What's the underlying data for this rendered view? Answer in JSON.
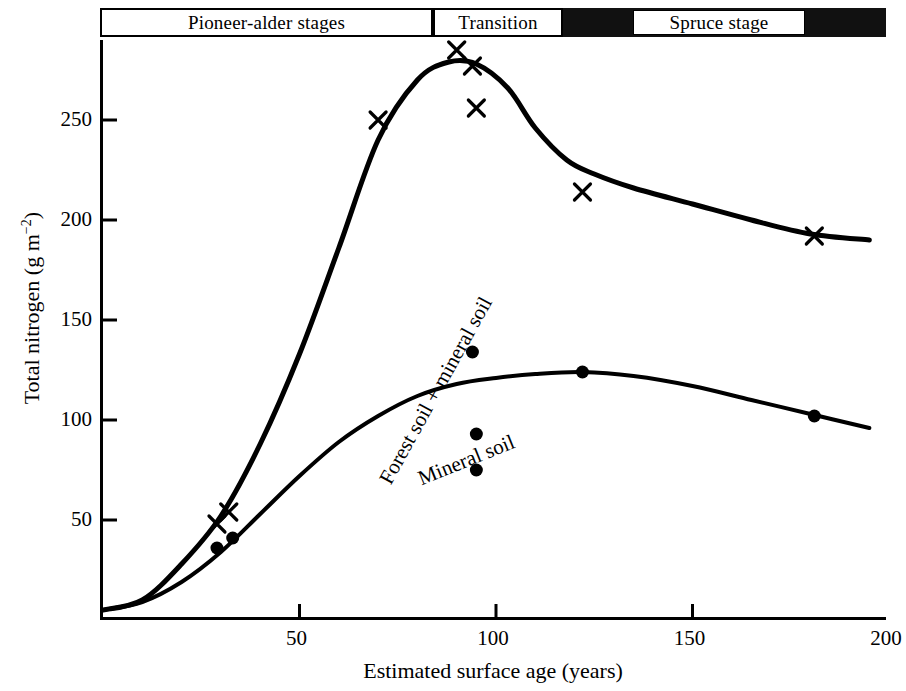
{
  "figure": {
    "background_color": "#ffffff",
    "ink_color": "#000000"
  },
  "stages": {
    "pioneer": "Pioneer-alder stages",
    "transition": "Transition",
    "spruce": "Spruce stage"
  },
  "axes": {
    "x_title": "Estimated surface age (years)",
    "y_title_main": "Total nitrogen (g m",
    "y_title_sup": "−2",
    "y_title_close": ")",
    "x_ticks": [
      "50",
      "100",
      "150",
      "200"
    ],
    "y_ticks": [
      "50",
      "100",
      "150",
      "200",
      "250"
    ]
  },
  "curve_labels": {
    "forest": "Forest soil + mineral soil",
    "mineral": "Mineral soil"
  },
  "chart_data": {
    "type": "line",
    "title": "",
    "subtitle": "",
    "xlabel": "Estimated surface age (years)",
    "ylabel": "Total nitrogen (g m−2)",
    "xlim": [
      0,
      200
    ],
    "ylim": [
      0,
      290
    ],
    "grid": false,
    "legend_position": "inline-curve-labels",
    "x_ticks": [
      50,
      100,
      150,
      200
    ],
    "y_ticks": [
      50,
      100,
      150,
      200,
      250
    ],
    "annotations": [
      {
        "text": "Pioneer-alder stages",
        "region": "banner",
        "x_range": [
          0,
          85
        ]
      },
      {
        "text": "Transition",
        "region": "banner",
        "x_range": [
          85,
          118
        ]
      },
      {
        "text": "Spruce stage",
        "region": "banner",
        "x_range": [
          118,
          200
        ]
      },
      {
        "text": "Forest soil + mineral soil",
        "region": "upper-curve",
        "rotation_deg": -61
      },
      {
        "text": "Mineral soil",
        "region": "lower-curve",
        "rotation_deg": -22
      }
    ],
    "series": [
      {
        "name": "Forest soil + mineral soil",
        "marker": "x",
        "curve": [
          [
            0,
            5
          ],
          [
            10,
            10
          ],
          [
            20,
            28
          ],
          [
            30,
            52
          ],
          [
            40,
            88
          ],
          [
            50,
            133
          ],
          [
            60,
            186
          ],
          [
            70,
            240
          ],
          [
            80,
            270
          ],
          [
            88,
            279
          ],
          [
            95,
            278
          ],
          [
            103,
            266
          ],
          [
            110,
            246
          ],
          [
            118,
            230
          ],
          [
            125,
            223
          ],
          [
            135,
            216
          ],
          [
            150,
            208
          ],
          [
            165,
            200
          ],
          [
            180,
            193
          ],
          [
            195,
            190
          ]
        ],
        "points": [
          {
            "x": 29,
            "y": 48
          },
          {
            "x": 32,
            "y": 54
          },
          {
            "x": 70,
            "y": 250
          },
          {
            "x": 90,
            "y": 285
          },
          {
            "x": 94,
            "y": 277
          },
          {
            "x": 95,
            "y": 256
          },
          {
            "x": 122,
            "y": 214
          },
          {
            "x": 181,
            "y": 192
          }
        ]
      },
      {
        "name": "Mineral soil",
        "marker": "circle",
        "curve": [
          [
            0,
            5
          ],
          [
            10,
            9
          ],
          [
            20,
            19
          ],
          [
            30,
            34
          ],
          [
            40,
            53
          ],
          [
            50,
            72
          ],
          [
            60,
            89
          ],
          [
            70,
            102
          ],
          [
            80,
            112
          ],
          [
            90,
            118
          ],
          [
            100,
            121
          ],
          [
            110,
            123
          ],
          [
            122,
            124
          ],
          [
            135,
            122
          ],
          [
            150,
            117
          ],
          [
            165,
            110
          ],
          [
            180,
            103
          ],
          [
            195,
            96
          ]
        ],
        "points": [
          {
            "x": 29,
            "y": 36
          },
          {
            "x": 33,
            "y": 41
          },
          {
            "x": 94,
            "y": 134
          },
          {
            "x": 95,
            "y": 93
          },
          {
            "x": 95,
            "y": 75
          },
          {
            "x": 122,
            "y": 124
          },
          {
            "x": 181,
            "y": 102
          }
        ]
      }
    ]
  }
}
